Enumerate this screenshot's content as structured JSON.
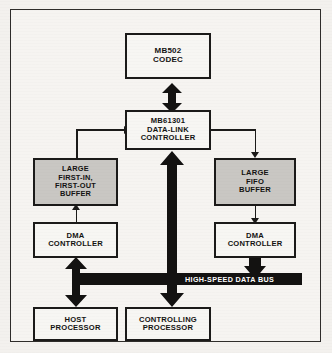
{
  "diagram": {
    "colors": {
      "ink": "#1b1a19",
      "paper": "#f6f4f1",
      "shaded_box": "#c9c7c3",
      "bus_band": "#131211",
      "bus_text": "#ffffff"
    },
    "blocks": {
      "codec": {
        "line1": "MB502",
        "line2": "CODEC"
      },
      "data_link_controller": {
        "line1": "MB61301",
        "line2": "DATA-LINK",
        "line3": "CONTROLLER"
      },
      "left_buffer": {
        "line1": "LARGE",
        "line2": "FIRST-IN,",
        "line3": "FIRST-OUT",
        "line4": "BUFFER"
      },
      "right_buffer": {
        "line1": "LARGE",
        "line2": "FIFO",
        "line3": "BUFFER"
      },
      "left_dma": {
        "line1": "DMA",
        "line2": "CONTROLLER"
      },
      "right_dma": {
        "line1": "DMA",
        "line2": "CONTROLLER"
      },
      "host_processor": {
        "line1": "HOST",
        "line2": "PROCESSOR"
      },
      "controlling_processor": {
        "line1": "CONTROLLING",
        "line2": "PROCESSOR"
      }
    },
    "bus": {
      "label": "HIGH-SPEED DATA BUS"
    },
    "connectors": {
      "codec_to_dlc": "bidirectional-thick-arrow",
      "dlc_to_controlling_processor": "bidirectional-thick-arrow",
      "left_buffer_to_dlc": "thin-line-arrow-right",
      "dlc_to_right_buffer": "thin-line-arrow-down",
      "left_dma_to_left_buffer": "thin-line-arrow-up",
      "right_buffer_to_right_dma": "thin-line-arrow-down",
      "left_dma_to_host_processor": "bidirectional-thick-arrow",
      "right_dma_to_bus": "thick-arrow-down",
      "bus_to_left_trunk": "thick-bus-branch"
    }
  }
}
